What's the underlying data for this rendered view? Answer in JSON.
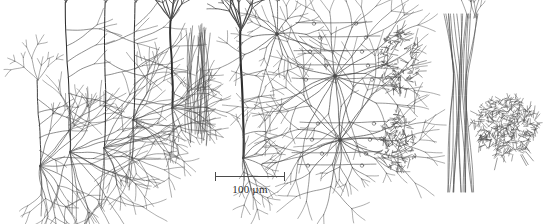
{
  "figure": {
    "width": 545,
    "height": 224,
    "background_color": "#ffffff",
    "ink_color": "#4a4a4a",
    "ink_color_dark": "#2e2e2e",
    "technique": "camera-lucida line drawing of Golgi-stained cortical neurons"
  },
  "scalebar": {
    "label": "100 µm",
    "x": 215,
    "y": 172,
    "length": 70,
    "cap_height": 9,
    "color": "#4b4b4b"
  },
  "chart_data": {
    "type": "diagram",
    "title": "",
    "xlabel": "",
    "ylabel": "",
    "scale_reference": "100 µm",
    "groups": [
      {
        "id": "group-1",
        "name": "pyramidal-cell-cluster",
        "description": "cluster of layer V pyramidal neurons with long apical trunks and dense basal dendrites",
        "cells": [
          {
            "kind": "pyramidal",
            "soma_x": 70,
            "soma_y": 152,
            "apical_height": 150,
            "apical_lean": -4,
            "trunk_width": 1.05,
            "tuft_span": 26,
            "tuft_height": 30,
            "tuft_branches": 6,
            "oblique_count": 7,
            "oblique_len": 30,
            "basal_count": 11,
            "basal_len": 46,
            "basal_spread": 1.45,
            "axon_len": 62,
            "axon_lean": 3,
            "seed": 101
          },
          {
            "kind": "pyramidal",
            "soma_x": 104,
            "soma_y": 148,
            "apical_height": 146,
            "apical_lean": 2,
            "trunk_width": 1.0,
            "tuft_span": 24,
            "tuft_height": 28,
            "tuft_branches": 5,
            "oblique_count": 7,
            "oblique_len": 34,
            "basal_count": 10,
            "basal_len": 44,
            "basal_spread": 1.4,
            "axon_len": 60,
            "axon_lean": -2,
            "seed": 202
          },
          {
            "kind": "pyramidal",
            "soma_x": 40,
            "soma_y": 166,
            "apical_height": 86,
            "apical_lean": -2,
            "trunk_width": 0.9,
            "tuft_span": 18,
            "tuft_height": 18,
            "tuft_branches": 4,
            "oblique_count": 5,
            "oblique_len": 26,
            "basal_count": 12,
            "basal_len": 42,
            "basal_spread": 1.6,
            "axon_len": 50,
            "axon_lean": 2,
            "seed": 303
          },
          {
            "kind": "pyramidal",
            "soma_x": 133,
            "soma_y": 120,
            "apical_height": 118,
            "apical_lean": 3,
            "trunk_width": 1.0,
            "tuft_span": 22,
            "tuft_height": 24,
            "tuft_branches": 5,
            "oblique_count": 6,
            "oblique_len": 38,
            "basal_count": 9,
            "basal_len": 48,
            "basal_spread": 1.5,
            "axon_len": 70,
            "axon_lean": -3,
            "seed": 404
          }
        ]
      },
      {
        "id": "group-2",
        "name": "isolated-pyramidal-left",
        "description": "single pyramidal neuron with thick dark apical trunk and apical tuft",
        "cells": [
          {
            "kind": "pyramidal",
            "soma_x": 172,
            "soma_y": 108,
            "apical_height": 88,
            "apical_lean": -1,
            "trunk_width": 1.9,
            "tuft_span": 26,
            "tuft_height": 22,
            "tuft_branches": 7,
            "oblique_count": 3,
            "oblique_len": 18,
            "basal_count": 9,
            "basal_len": 26,
            "basal_spread": 1.5,
            "axon_len": 44,
            "axon_lean": 2,
            "seed": 505
          }
        ]
      },
      {
        "id": "group-3",
        "name": "vertical-fiber-bundle",
        "description": "narrow bundle of thin vertically streaming axon fibers",
        "cells": [
          {
            "kind": "fiber-bundle",
            "center_x": 200,
            "top_y": 22,
            "bottom_y": 146,
            "width": 26,
            "fiber_count": 16,
            "branch_density": 0.5,
            "seed": 606
          }
        ]
      },
      {
        "id": "group-4",
        "name": "isolated-pyramidal-right",
        "description": "tall pyramidal neuron with very long dark apical trunk and basal splay",
        "cells": [
          {
            "kind": "pyramidal",
            "soma_x": 243,
            "soma_y": 158,
            "apical_height": 128,
            "apical_lean": -2,
            "trunk_width": 2.1,
            "tuft_span": 24,
            "tuft_height": 26,
            "tuft_branches": 7,
            "oblique_count": 3,
            "oblique_len": 20,
            "basal_count": 10,
            "basal_len": 24,
            "basal_spread": 1.7,
            "axon_len": 30,
            "axon_lean": 1,
            "seed": 707
          }
        ]
      },
      {
        "id": "group-5",
        "name": "stellate-cell-upper",
        "description": "multipolar stellate neuron with radiating dendrites",
        "cells": [
          {
            "kind": "stellate",
            "soma_x": 277,
            "soma_y": 34,
            "radius": 30,
            "dendrite_count": 14,
            "branch_depth": 2,
            "seed": 808
          }
        ]
      },
      {
        "id": "group-6",
        "name": "stellate-pair-with-boutons",
        "description": "two large stellate neurons with radiating dendrites and horizontal axon collaterals bearing terminal boutons",
        "cells": [
          {
            "kind": "stellate",
            "soma_x": 335,
            "soma_y": 76,
            "radius": 48,
            "dendrite_count": 18,
            "branch_depth": 2,
            "seed": 909
          },
          {
            "kind": "stellate",
            "soma_x": 340,
            "soma_y": 140,
            "radius": 46,
            "dendrite_count": 18,
            "branch_depth": 2,
            "seed": 1010
          }
        ],
        "collaterals": [
          {
            "y": 22,
            "x1": 296,
            "x2": 372,
            "boutons": [
              314,
              356
            ]
          },
          {
            "y": 36,
            "x1": 300,
            "x2": 380,
            "boutons": [
              320,
              366
            ]
          },
          {
            "y": 50,
            "x1": 294,
            "x2": 378,
            "boutons": [
              310,
              362
            ]
          },
          {
            "y": 64,
            "x1": 298,
            "x2": 376,
            "boutons": [
              326,
              368
            ]
          },
          {
            "y": 78,
            "x1": 292,
            "x2": 382,
            "boutons": [
              306,
              372
            ]
          },
          {
            "y": 122,
            "x1": 300,
            "x2": 386,
            "boutons": [
              318,
              374
            ]
          },
          {
            "y": 138,
            "x1": 296,
            "x2": 384,
            "boutons": [
              312,
              370
            ]
          },
          {
            "y": 152,
            "x1": 292,
            "x2": 380,
            "boutons": [
              322,
              366
            ]
          },
          {
            "y": 164,
            "x1": 298,
            "x2": 376,
            "boutons": [
              308,
              362
            ]
          }
        ]
      },
      {
        "id": "group-7",
        "name": "bushy-arbor-upper",
        "description": "compact bushy spiny dendritic arbor",
        "cells": [
          {
            "kind": "bush",
            "center_x": 400,
            "center_y": 62,
            "radius_x": 20,
            "radius_y": 34,
            "density": 130,
            "spines": true,
            "seed": 1111
          }
        ]
      },
      {
        "id": "group-8",
        "name": "bushy-arbor-lower",
        "description": "compact bushy spiny dendritic arbor, lower",
        "cells": [
          {
            "kind": "bush",
            "center_x": 398,
            "center_y": 142,
            "radius_x": 19,
            "radius_y": 30,
            "density": 118,
            "spines": true,
            "seed": 1212
          }
        ]
      },
      {
        "id": "group-9",
        "name": "double-bouquet-descending-bundle",
        "description": "double-bouquet cell with long vertically descending axon bundle",
        "cells": [
          {
            "kind": "descending-bundle",
            "center_x": 460,
            "top_y": 14,
            "bottom_y": 192,
            "waist_y": 78,
            "width_top": 34,
            "width_waist": 12,
            "width_bottom": 30,
            "fiber_count": 15,
            "seed": 1313
          }
        ]
      },
      {
        "id": "group-10",
        "name": "dense-axonal-plexus",
        "description": "dense spherical axonal plexus of a basket-type interneuron",
        "cells": [
          {
            "kind": "plexus",
            "center_x": 505,
            "center_y": 126,
            "radius": 33,
            "density": 420,
            "seed": 1414
          }
        ]
      }
    ]
  }
}
